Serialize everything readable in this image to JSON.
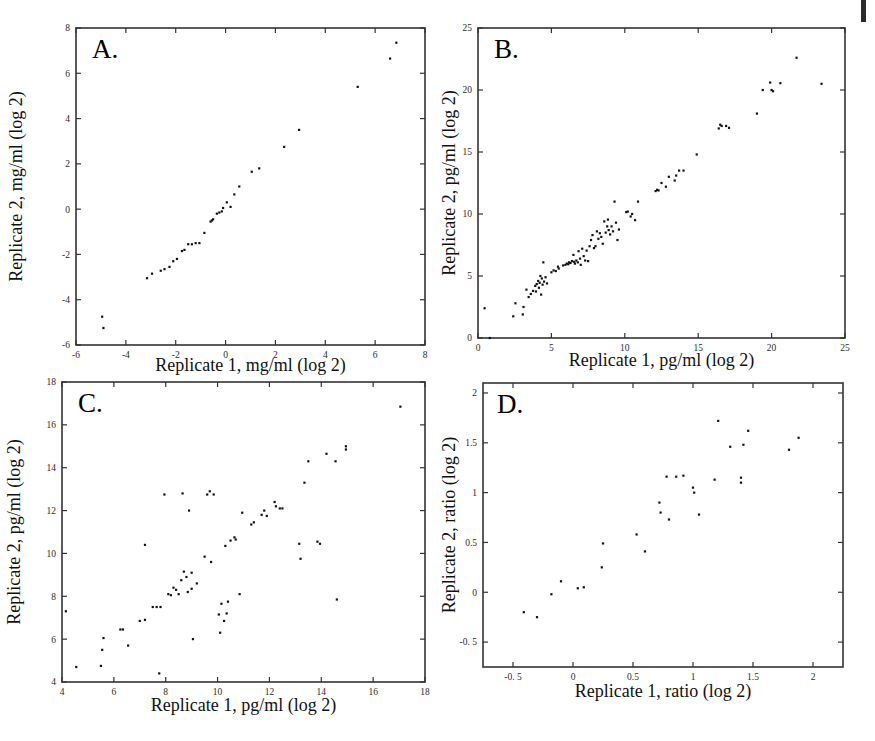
{
  "figure": {
    "caption_letters": [
      "A.",
      "B.",
      "C.",
      "D."
    ]
  },
  "chart_data": [
    {
      "id": "panel-a",
      "type": "scatter",
      "title": "A.",
      "xlabel": "Replicate 1, mg/ml (log 2)",
      "ylabel": "Replicate 2, mg/ml (log 2)",
      "xlim": [
        -6,
        8
      ],
      "ylim": [
        -6,
        8
      ],
      "xticks": [
        -6,
        -4,
        -2,
        0,
        2,
        4,
        6,
        8
      ],
      "yticks": [
        -6,
        -4,
        -2,
        0,
        2,
        4,
        6,
        8
      ],
      "xticklabels": [
        "-6",
        "-4",
        "-2",
        "0",
        "2",
        "4",
        "6",
        "8"
      ],
      "yticklabels": [
        "-6",
        "-4",
        "-2",
        "0",
        "2",
        "4",
        "6",
        "8"
      ],
      "grid": false,
      "legend": "none",
      "points": [
        [
          -4.95,
          -4.75
        ],
        [
          -4.9,
          -5.25
        ],
        [
          -3.15,
          -3.05
        ],
        [
          -2.95,
          -2.85
        ],
        [
          -2.6,
          -2.72
        ],
        [
          -2.45,
          -2.65
        ],
        [
          -2.25,
          -2.55
        ],
        [
          -2.1,
          -2.3
        ],
        [
          -1.95,
          -2.2
        ],
        [
          -1.75,
          -1.85
        ],
        [
          -1.65,
          -1.8
        ],
        [
          -1.5,
          -1.55
        ],
        [
          -1.35,
          -1.55
        ],
        [
          -1.2,
          -1.5
        ],
        [
          -1.05,
          -1.5
        ],
        [
          -0.85,
          -1.05
        ],
        [
          -0.6,
          -0.55
        ],
        [
          -0.55,
          -0.5
        ],
        [
          -0.5,
          -0.45
        ],
        [
          -0.35,
          -0.2
        ],
        [
          -0.25,
          -0.15
        ],
        [
          -0.15,
          -0.1
        ],
        [
          -0.1,
          0.05
        ],
        [
          0.05,
          0.3
        ],
        [
          0.2,
          0.1
        ],
        [
          0.35,
          0.65
        ],
        [
          0.55,
          1.0
        ],
        [
          1.05,
          1.65
        ],
        [
          1.35,
          1.8
        ],
        [
          2.35,
          2.75
        ],
        [
          2.95,
          3.5
        ],
        [
          5.3,
          5.4
        ],
        [
          6.6,
          6.65
        ],
        [
          6.85,
          7.35
        ]
      ]
    },
    {
      "id": "panel-b",
      "type": "scatter",
      "title": "B.",
      "xlabel": "Replicate 1, pg/ml (log 2)",
      "ylabel": "Replicate 2, pg/ml (log 2)",
      "xlim": [
        0,
        25
      ],
      "ylim": [
        0,
        25
      ],
      "xticks": [
        0,
        5,
        10,
        15,
        20,
        25
      ],
      "yticks": [
        0,
        5,
        10,
        15,
        20,
        25
      ],
      "xticklabels": [
        "0",
        "5",
        "10",
        "15",
        "20",
        "25"
      ],
      "yticklabels": [
        "0",
        "5",
        "10",
        "15",
        "20",
        "25"
      ],
      "grid": false,
      "legend": "none",
      "points": [
        [
          0.45,
          2.4
        ],
        [
          0.8,
          0.0
        ],
        [
          2.4,
          1.75
        ],
        [
          2.55,
          2.8
        ],
        [
          3.05,
          1.9
        ],
        [
          3.1,
          2.5
        ],
        [
          3.3,
          3.9
        ],
        [
          3.45,
          3.3
        ],
        [
          3.6,
          3.55
        ],
        [
          3.75,
          3.8
        ],
        [
          3.9,
          4.2
        ],
        [
          3.95,
          3.75
        ],
        [
          4.0,
          4.35
        ],
        [
          4.1,
          4.6
        ],
        [
          4.15,
          4.05
        ],
        [
          4.2,
          4.45
        ],
        [
          4.25,
          5.0
        ],
        [
          4.3,
          3.5
        ],
        [
          4.35,
          4.8
        ],
        [
          4.4,
          4.3
        ],
        [
          4.45,
          6.1
        ],
        [
          4.5,
          4.55
        ],
        [
          4.6,
          4.9
        ],
        [
          4.7,
          4.4
        ],
        [
          5.0,
          5.3
        ],
        [
          5.15,
          5.45
        ],
        [
          5.3,
          5.4
        ],
        [
          5.45,
          5.75
        ],
        [
          5.5,
          5.6
        ],
        [
          5.8,
          5.85
        ],
        [
          5.95,
          5.9
        ],
        [
          6.05,
          6.0
        ],
        [
          6.15,
          5.95
        ],
        [
          6.2,
          6.1
        ],
        [
          6.3,
          6.05
        ],
        [
          6.4,
          6.2
        ],
        [
          6.5,
          6.7
        ],
        [
          6.55,
          6.15
        ],
        [
          6.6,
          6.0
        ],
        [
          6.7,
          6.25
        ],
        [
          6.8,
          6.1
        ],
        [
          6.85,
          7.0
        ],
        [
          6.95,
          6.4
        ],
        [
          7.0,
          5.9
        ],
        [
          7.1,
          7.2
        ],
        [
          7.2,
          6.6
        ],
        [
          7.3,
          6.25
        ],
        [
          7.4,
          7.05
        ],
        [
          7.5,
          6.2
        ],
        [
          7.6,
          7.4
        ],
        [
          7.7,
          7.9
        ],
        [
          7.8,
          8.3
        ],
        [
          7.9,
          7.25
        ],
        [
          8.0,
          7.4
        ],
        [
          8.1,
          8.6
        ],
        [
          8.2,
          8.0
        ],
        [
          8.3,
          8.45
        ],
        [
          8.4,
          8.15
        ],
        [
          8.5,
          7.6
        ],
        [
          8.6,
          9.4
        ],
        [
          8.7,
          8.5
        ],
        [
          8.8,
          9.0
        ],
        [
          8.85,
          9.55
        ],
        [
          8.9,
          8.7
        ],
        [
          9.0,
          8.35
        ],
        [
          9.1,
          9.0
        ],
        [
          9.2,
          8.6
        ],
        [
          9.3,
          11.0
        ],
        [
          9.4,
          9.3
        ],
        [
          9.5,
          7.9
        ],
        [
          9.6,
          8.75
        ],
        [
          10.1,
          10.15
        ],
        [
          10.2,
          10.2
        ],
        [
          10.4,
          9.8
        ],
        [
          10.5,
          10.0
        ],
        [
          10.7,
          9.5
        ],
        [
          10.9,
          11.0
        ],
        [
          12.1,
          11.85
        ],
        [
          12.2,
          11.95
        ],
        [
          12.3,
          11.9
        ],
        [
          12.5,
          12.5
        ],
        [
          12.8,
          12.2
        ],
        [
          13.0,
          13.0
        ],
        [
          13.4,
          12.7
        ],
        [
          13.5,
          13.1
        ],
        [
          13.7,
          13.5
        ],
        [
          14.0,
          13.5
        ],
        [
          14.9,
          14.8
        ],
        [
          16.4,
          16.9
        ],
        [
          16.5,
          17.2
        ],
        [
          16.6,
          17.1
        ],
        [
          16.9,
          17.1
        ],
        [
          17.1,
          16.95
        ],
        [
          19.0,
          18.1
        ],
        [
          19.4,
          20.0
        ],
        [
          19.9,
          20.6
        ],
        [
          20.0,
          20.0
        ],
        [
          20.1,
          19.9
        ],
        [
          20.6,
          20.55
        ],
        [
          21.7,
          22.6
        ],
        [
          23.4,
          20.5
        ]
      ]
    },
    {
      "id": "panel-c",
      "type": "scatter",
      "title": "C.",
      "xlabel": "Replicate 1, pg/ml (log 2)",
      "ylabel": "Replicate 2, pg/ml (log 2)",
      "xlim": [
        4,
        18
      ],
      "ylim": [
        4,
        18
      ],
      "xticks": [
        4,
        6,
        8,
        10,
        12,
        14,
        16,
        18
      ],
      "yticks": [
        4,
        6,
        8,
        10,
        12,
        14,
        16,
        18
      ],
      "xticklabels": [
        "4",
        "6",
        "8",
        "10",
        "12",
        "14",
        "16",
        "18"
      ],
      "yticklabels": [
        "4",
        "6",
        "8",
        "10",
        "12",
        "14",
        "16",
        "18"
      ],
      "grid": false,
      "legend": "none",
      "points": [
        [
          4.15,
          7.3
        ],
        [
          4.55,
          4.7
        ],
        [
          5.5,
          4.75
        ],
        [
          5.55,
          5.5
        ],
        [
          5.6,
          6.05
        ],
        [
          6.25,
          6.45
        ],
        [
          6.35,
          6.45
        ],
        [
          6.55,
          5.7
        ],
        [
          7.0,
          6.85
        ],
        [
          7.2,
          6.9
        ],
        [
          7.2,
          10.4
        ],
        [
          7.5,
          7.5
        ],
        [
          7.65,
          7.5
        ],
        [
          7.8,
          7.5
        ],
        [
          7.75,
          4.4
        ],
        [
          7.95,
          12.75
        ],
        [
          8.1,
          8.1
        ],
        [
          8.2,
          8.05
        ],
        [
          8.3,
          8.4
        ],
        [
          8.4,
          8.3
        ],
        [
          8.5,
          8.1
        ],
        [
          8.6,
          8.75
        ],
        [
          8.65,
          12.8
        ],
        [
          8.7,
          9.15
        ],
        [
          8.8,
          8.9
        ],
        [
          8.85,
          8.2
        ],
        [
          8.9,
          12.0
        ],
        [
          9.0,
          8.35
        ],
        [
          9.0,
          9.1
        ],
        [
          9.05,
          6.0
        ],
        [
          9.2,
          8.6
        ],
        [
          9.5,
          9.85
        ],
        [
          9.6,
          12.75
        ],
        [
          9.7,
          12.9
        ],
        [
          9.75,
          9.6
        ],
        [
          9.85,
          12.75
        ],
        [
          10.05,
          7.15
        ],
        [
          10.1,
          6.3
        ],
        [
          10.15,
          7.65
        ],
        [
          10.25,
          6.85
        ],
        [
          10.3,
          10.35
        ],
        [
          10.35,
          7.2
        ],
        [
          10.4,
          7.75
        ],
        [
          10.5,
          10.6
        ],
        [
          10.65,
          10.75
        ],
        [
          10.7,
          10.65
        ],
        [
          10.85,
          8.1
        ],
        [
          10.95,
          11.9
        ],
        [
          11.3,
          11.35
        ],
        [
          11.4,
          11.45
        ],
        [
          11.7,
          11.8
        ],
        [
          11.8,
          12.0
        ],
        [
          11.9,
          11.75
        ],
        [
          12.2,
          12.4
        ],
        [
          12.25,
          12.2
        ],
        [
          12.4,
          12.1
        ],
        [
          12.5,
          12.1
        ],
        [
          13.15,
          10.45
        ],
        [
          13.2,
          9.75
        ],
        [
          13.35,
          13.3
        ],
        [
          13.5,
          14.3
        ],
        [
          13.85,
          10.55
        ],
        [
          13.95,
          10.45
        ],
        [
          14.2,
          14.65
        ],
        [
          14.55,
          14.3
        ],
        [
          14.6,
          7.85
        ],
        [
          14.95,
          14.85
        ],
        [
          14.95,
          15.0
        ],
        [
          17.05,
          16.85
        ]
      ]
    },
    {
      "id": "panel-d",
      "type": "scatter",
      "title": "D.",
      "xlabel": "Replicate 1, ratio (log 2)",
      "ylabel": "Replicate 2, ratio (log 2)",
      "xlim": [
        -0.75,
        2.25
      ],
      "ylim": [
        -0.75,
        2.1
      ],
      "xticks": [
        -0.5,
        0,
        0.5,
        1,
        1.5,
        2
      ],
      "yticks": [
        -0.5,
        0,
        0.5,
        1,
        1.5,
        2
      ],
      "xticklabels": [
        "-0. 5",
        "0",
        "0.5",
        "1",
        "1.5",
        "2"
      ],
      "yticklabels": [
        "-0. 5",
        "0",
        "0.5",
        "1",
        "1.5",
        "2"
      ],
      "grid": false,
      "legend": "none",
      "points": [
        [
          -0.41,
          -0.2
        ],
        [
          -0.3,
          -0.25
        ],
        [
          -0.18,
          -0.02
        ],
        [
          -0.1,
          0.11
        ],
        [
          0.04,
          0.04
        ],
        [
          0.09,
          0.05
        ],
        [
          0.24,
          0.25
        ],
        [
          0.25,
          0.49
        ],
        [
          0.53,
          0.58
        ],
        [
          0.6,
          0.41
        ],
        [
          0.72,
          0.9
        ],
        [
          0.73,
          0.8
        ],
        [
          0.78,
          1.16
        ],
        [
          0.8,
          0.73
        ],
        [
          0.86,
          1.16
        ],
        [
          0.92,
          1.17
        ],
        [
          1.0,
          1.05
        ],
        [
          1.01,
          1.0
        ],
        [
          1.05,
          0.78
        ],
        [
          1.18,
          1.13
        ],
        [
          1.21,
          1.72
        ],
        [
          1.31,
          1.46
        ],
        [
          1.4,
          1.15
        ],
        [
          1.4,
          1.1
        ],
        [
          1.42,
          1.48
        ],
        [
          1.46,
          1.62
        ],
        [
          1.8,
          1.43
        ],
        [
          1.88,
          1.55
        ]
      ]
    }
  ]
}
